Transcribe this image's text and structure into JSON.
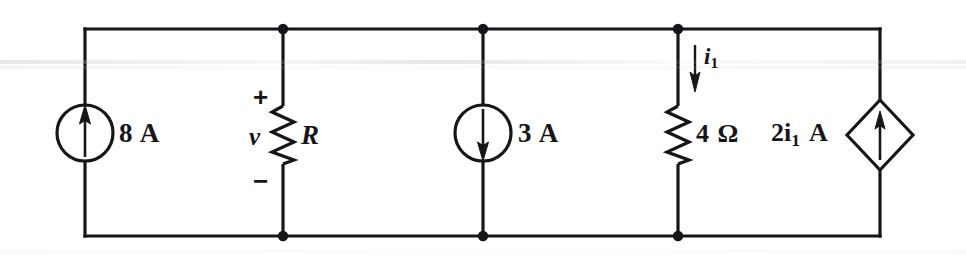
{
  "figure": {
    "kind": "electrical-circuit-schematic",
    "line_color": "#16161a",
    "background_color": "#ffffff"
  },
  "components": {
    "source_8a": {
      "type": "independent-current-source",
      "symbol": "circle",
      "arrow_direction": "up",
      "label": "8 A",
      "value": "8",
      "unit": "A"
    },
    "resistor_r": {
      "type": "resistor",
      "symbol": "zigzag",
      "label": "R",
      "voltage_label": "v",
      "polarity_plus": "+",
      "polarity_minus": "−"
    },
    "source_3a": {
      "type": "independent-current-source",
      "symbol": "circle",
      "arrow_direction": "down",
      "label": "3 A",
      "value": "3",
      "unit": "A"
    },
    "resistor_4ohm": {
      "type": "resistor",
      "symbol": "zigzag",
      "label": "4 Ω",
      "value": "4",
      "unit": "Ω",
      "current_label_prefix": "i",
      "current_label_subscript": "1",
      "current_arrow_direction": "down"
    },
    "dependent_source": {
      "type": "current-controlled-current-source",
      "symbol": "diamond",
      "arrow_direction": "up",
      "label_prefix": "2i",
      "label_subscript": "1",
      "label_suffix": "A",
      "label_full": "2i₁ A"
    }
  }
}
